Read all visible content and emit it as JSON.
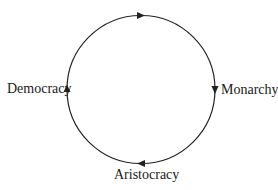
{
  "diagram": {
    "type": "cycle",
    "direction": "clockwise",
    "stroke_color": "#222222",
    "nodes": [
      {
        "label": "Monarchy",
        "position": "right"
      },
      {
        "label": "Aristocracy",
        "position": "bottom"
      },
      {
        "label": "Democracy",
        "position": "left"
      }
    ],
    "edges": [
      {
        "from": "Monarchy",
        "to": "Aristocracy"
      },
      {
        "from": "Aristocracy",
        "to": "Democracy"
      },
      {
        "from": "Democracy",
        "to": "Monarchy"
      }
    ]
  }
}
